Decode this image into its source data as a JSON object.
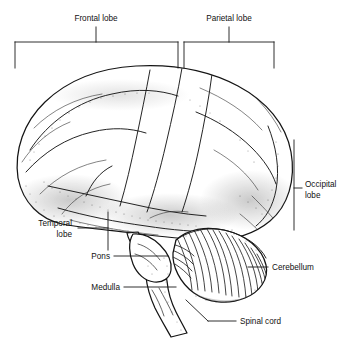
{
  "figure": {
    "background_color": "#ffffff",
    "ink_color": "#141414",
    "width": 345,
    "height": 340
  },
  "labels": {
    "frontal_lobe": "Frontal lobe",
    "parietal_lobe": "Parietal lobe",
    "occipital_lobe_line1": "Occipital",
    "occipital_lobe_line2": "lobe",
    "temporal_lobe_line1": "Temporal",
    "temporal_lobe_line2": "lobe",
    "pons": "Pons",
    "medulla": "Medulla",
    "cerebellum": "Cerebellum",
    "spinal_cord": "Spinal cord"
  }
}
